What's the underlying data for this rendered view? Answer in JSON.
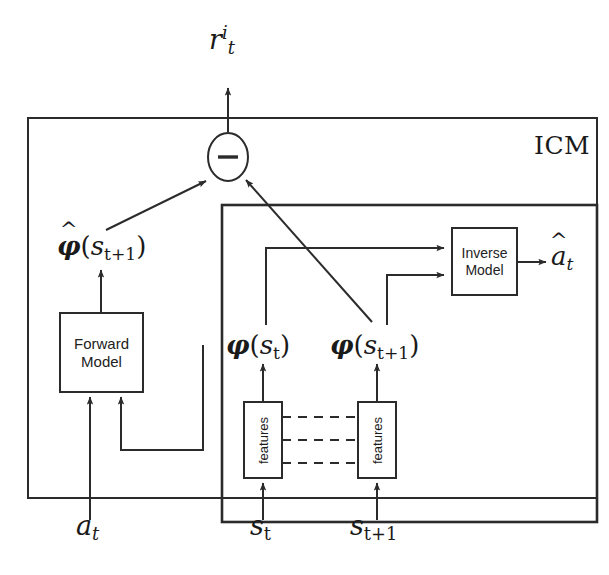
{
  "diagram": {
    "title_label": "ICM",
    "boxes": {
      "forward_model": "Forward\nModel",
      "forward_model_line1": "Forward",
      "forward_model_line2": "Model",
      "inverse_model_line1": "Inverse",
      "inverse_model_line2": "Model",
      "features_left": "features",
      "features_right": "features"
    },
    "operator": {
      "name": "subtract",
      "glyph": "−"
    },
    "labels": {
      "reward": {
        "base": "r",
        "sup": "i",
        "sub": "t"
      },
      "phi_hat_next": {
        "base": "φ",
        "hat": true,
        "arg_base": "s",
        "arg_sub": "t+1"
      },
      "phi_current": {
        "base": "φ",
        "hat": false,
        "arg_base": "s",
        "arg_sub": "t"
      },
      "phi_next": {
        "base": "φ",
        "hat": false,
        "arg_base": "s",
        "arg_sub": "t+1"
      },
      "action_hat": {
        "base": "a",
        "hat": true,
        "sub": "t"
      },
      "action": {
        "base": "a",
        "sub": "t"
      },
      "state_current": {
        "base": "s",
        "sub": "t"
      },
      "state_next": {
        "base": "s",
        "sub": "t+1"
      }
    },
    "colors": {
      "stroke": "#2b2b2b",
      "background": "#ffffff",
      "text": "#1a1a1a"
    },
    "dashed_connections": 3
  }
}
